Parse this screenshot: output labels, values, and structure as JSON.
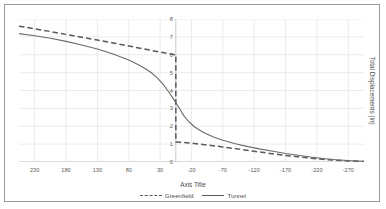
{
  "chart_data": {
    "type": "line",
    "title": "",
    "xlabel": "Axis Title",
    "ylabel": "Total Displacements (in)",
    "xlim": [
      255,
      -295
    ],
    "ylim": [
      0,
      8
    ],
    "x_reversed": true,
    "grid": true,
    "legend_position": "bottom",
    "xticks": [
      230,
      180,
      130,
      80,
      30,
      -20,
      -70,
      -120,
      -170,
      -220,
      -270
    ],
    "xtick_labels": [
      "230",
      "180",
      "130",
      "80",
      "30",
      "-20",
      "-70",
      "-120",
      "-170",
      "-220",
      "-270"
    ],
    "yticks": [
      0,
      1,
      2,
      3,
      4,
      5,
      6,
      7,
      8
    ],
    "ytick_labels": [
      "0",
      "1",
      "2",
      "3",
      "4",
      "5",
      "6",
      "7",
      "8"
    ],
    "y_axis_at_x": 5,
    "series": [
      {
        "name": "Greenfield",
        "style": "dashed",
        "color": "#595959",
        "discontinuity_at_x": 5,
        "points": [
          [
            255,
            7.6
          ],
          [
            230,
            7.45
          ],
          [
            205,
            7.3
          ],
          [
            180,
            7.14
          ],
          [
            155,
            6.98
          ],
          [
            130,
            6.82
          ],
          [
            105,
            6.66
          ],
          [
            80,
            6.49
          ],
          [
            55,
            6.32
          ],
          [
            30,
            6.15
          ],
          [
            15,
            6.05
          ],
          [
            6,
            6.0
          ],
          [
            5,
            6.0
          ],
          [
            5,
            1.12
          ],
          [
            4,
            1.12
          ],
          [
            -5,
            1.1
          ],
          [
            -20,
            1.05
          ],
          [
            -45,
            0.95
          ],
          [
            -70,
            0.84
          ],
          [
            -95,
            0.72
          ],
          [
            -120,
            0.6
          ],
          [
            -145,
            0.48
          ],
          [
            -170,
            0.37
          ],
          [
            -195,
            0.27
          ],
          [
            -220,
            0.18
          ],
          [
            -245,
            0.11
          ],
          [
            -270,
            0.06
          ],
          [
            -295,
            0.03
          ]
        ]
      },
      {
        "name": "Tunnel",
        "style": "solid",
        "color": "#6a6a6a",
        "points": [
          [
            255,
            7.18
          ],
          [
            230,
            7.06
          ],
          [
            205,
            6.92
          ],
          [
            180,
            6.75
          ],
          [
            155,
            6.55
          ],
          [
            130,
            6.32
          ],
          [
            105,
            6.04
          ],
          [
            80,
            5.7
          ],
          [
            60,
            5.36
          ],
          [
            45,
            5.02
          ],
          [
            35,
            4.72
          ],
          [
            25,
            4.34
          ],
          [
            18,
            4.0
          ],
          [
            12,
            3.7
          ],
          [
            5,
            3.32
          ],
          [
            -2,
            2.92
          ],
          [
            -8,
            2.58
          ],
          [
            -15,
            2.28
          ],
          [
            -25,
            1.96
          ],
          [
            -40,
            1.64
          ],
          [
            -55,
            1.4
          ],
          [
            -70,
            1.22
          ],
          [
            -90,
            1.02
          ],
          [
            -110,
            0.86
          ],
          [
            -130,
            0.72
          ],
          [
            -150,
            0.6
          ],
          [
            -170,
            0.48
          ],
          [
            -190,
            0.38
          ],
          [
            -210,
            0.28
          ],
          [
            -230,
            0.2
          ],
          [
            -250,
            0.13
          ],
          [
            -270,
            0.08
          ],
          [
            -295,
            0.04
          ]
        ]
      }
    ]
  },
  "legend": {
    "items": [
      {
        "label": "Greenfield"
      },
      {
        "label": "Tunnel"
      }
    ]
  },
  "style": {
    "line_color": "#595959",
    "grid_color": "#e6e6e6",
    "axis_color": "#bfbfbf",
    "text_color": "#4d4d4d",
    "border_color": "#9a9a9a"
  }
}
